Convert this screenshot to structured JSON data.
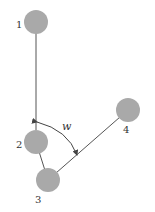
{
  "diagram": {
    "title": "",
    "node_color": "#a9a9a9",
    "line_color": "#555555",
    "nodes": [
      {
        "id": "1",
        "label": "1",
        "cx": 36,
        "cy": 22
      },
      {
        "id": "2",
        "label": "2",
        "cx": 36,
        "cy": 142
      },
      {
        "id": "3",
        "label": "3",
        "cx": 48,
        "cy": 180
      },
      {
        "id": "4",
        "label": "4",
        "cx": 128,
        "cy": 110
      }
    ],
    "edges": [
      {
        "from": "1",
        "to": "2"
      },
      {
        "from": "2",
        "to": "3"
      },
      {
        "from": "3",
        "to": "4"
      }
    ],
    "angle": {
      "label": "w",
      "between": [
        "1-2",
        "3-4"
      ]
    }
  }
}
